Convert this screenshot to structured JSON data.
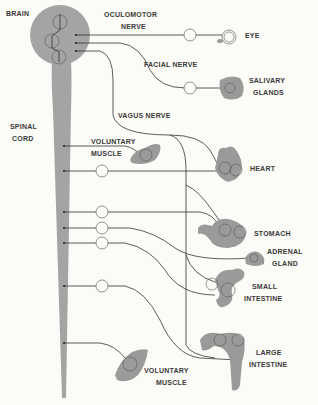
{
  "diagram": {
    "type": "autonomic nervous system illustration",
    "labels": {
      "brain": "BRAIN",
      "spinal_cord": [
        "SPINAL",
        "CORD"
      ],
      "oculomotor_nerve": [
        "OCULOMOTOR",
        "NERVE"
      ],
      "facial_nerve": "FACIAL NERVE",
      "vagus_nerve": "VAGUS NERVE",
      "eye": "EYE",
      "salivary_glands": [
        "SALIVARY",
        "GLANDS"
      ],
      "voluntary_muscle_upper": [
        "VOLUNTARY",
        "MUSCLE"
      ],
      "heart": "HEART",
      "stomach": "STOMACH",
      "adrenal_gland": [
        "ADRENAL",
        "GLAND"
      ],
      "small_intestine": [
        "SMALL",
        "INTESTINE"
      ],
      "large_intestine": [
        "LARGE",
        "INTESTINE"
      ],
      "voluntary_muscle_lower": [
        "VOLUNTARY",
        "MUSCLE"
      ]
    },
    "colors": {
      "background": "#fbfbf8",
      "tissue_gray": "#9a9a9a",
      "line": "#333333",
      "text": "#3a3a3a"
    }
  }
}
